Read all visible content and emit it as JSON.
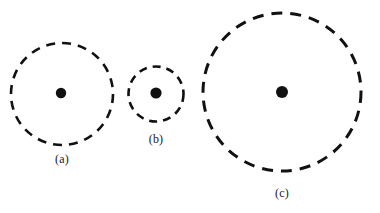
{
  "figure": {
    "caption_style": "lettered-subfigures",
    "background_color": "#ffffff",
    "stroke_color": "#111111",
    "dot_color": "#111111",
    "label_color": "#1a1a1a",
    "panels": [
      {
        "id": "panel-a",
        "label": "(a)",
        "label_x": 62,
        "label_y": 159,
        "circle": {
          "cx": 62,
          "cy": 94,
          "r": 51,
          "stroke_width": 2.6,
          "dash": "9 7",
          "style": "dashed"
        },
        "center_dot": {
          "cx": 61,
          "cy": 93,
          "r": 5.2
        }
      },
      {
        "id": "panel-b",
        "label": "(b)",
        "label_x": 156,
        "label_y": 139,
        "circle": {
          "cx": 156,
          "cy": 94,
          "r": 27.5,
          "stroke_width": 2.6,
          "dash": "8 6",
          "style": "dashed"
        },
        "center_dot": {
          "cx": 156,
          "cy": 93,
          "r": 5.6
        }
      },
      {
        "id": "panel-c",
        "label": "(c)",
        "label_x": 282,
        "label_y": 193,
        "circle": {
          "cx": 282,
          "cy": 92,
          "r": 79,
          "stroke_width": 3.0,
          "dash": "11 8",
          "style": "dashed"
        },
        "center_dot": {
          "cx": 282,
          "cy": 92,
          "r": 6.0
        }
      }
    ]
  },
  "chart_data": {
    "type": "scatter",
    "title": "",
    "subtitle": "",
    "xlabel": "",
    "ylabel": "",
    "grid": false,
    "legend": null,
    "categories": [
      "(a)",
      "(b)",
      "(c)"
    ],
    "series": [
      {
        "name": "dashed circle radius (px)",
        "values": [
          51,
          27.5,
          79
        ]
      },
      {
        "name": "center dot radius (px)",
        "values": [
          5.2,
          5.6,
          6.0
        ]
      }
    ],
    "points": [
      {
        "label": "(a)",
        "cx": 62,
        "cy": 94
      },
      {
        "label": "(b)",
        "cx": 156,
        "cy": 94
      },
      {
        "label": "(c)",
        "cx": 282,
        "cy": 92
      }
    ]
  }
}
